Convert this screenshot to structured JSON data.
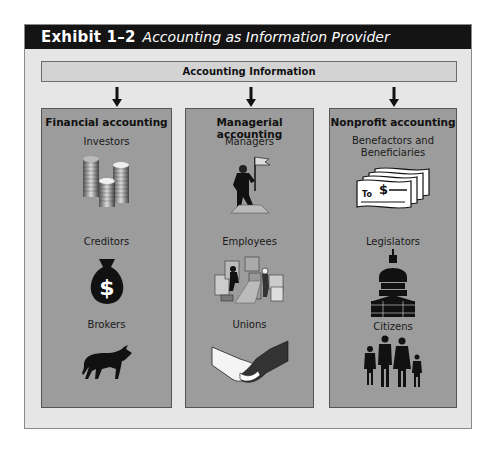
{
  "exhibit": {
    "number": "Exhibit 1–2",
    "title": "Accounting as Information Provider"
  },
  "source": {
    "label": "Accounting Information"
  },
  "columns": [
    {
      "heading": "Financial accounting",
      "users": [
        {
          "label": "Investors",
          "icon": "coin-stacks-icon"
        },
        {
          "label": "Creditors",
          "icon": "money-bag-icon"
        },
        {
          "label": "Brokers",
          "icon": "bull-icon"
        }
      ]
    },
    {
      "heading": "Managerial accounting",
      "users": [
        {
          "label": "Managers",
          "icon": "manager-flag-icon"
        },
        {
          "label": "Employees",
          "icon": "workers-boxes-icon"
        },
        {
          "label": "Unions",
          "icon": "handshake-icon"
        }
      ]
    },
    {
      "heading": "Nonprofit accounting",
      "users": [
        {
          "label": "Benefactors and Beneficiaries",
          "icon": "checks-icon"
        },
        {
          "label": "Legislators",
          "icon": "capitol-icon"
        },
        {
          "label": "Citizens",
          "icon": "family-icon"
        }
      ]
    }
  ],
  "colors": {
    "header_bg": "#141414",
    "frame_bg": "#e6e6e6",
    "column_bg": "#9c9c9c",
    "info_bar_bg": "#d3d3d3"
  }
}
